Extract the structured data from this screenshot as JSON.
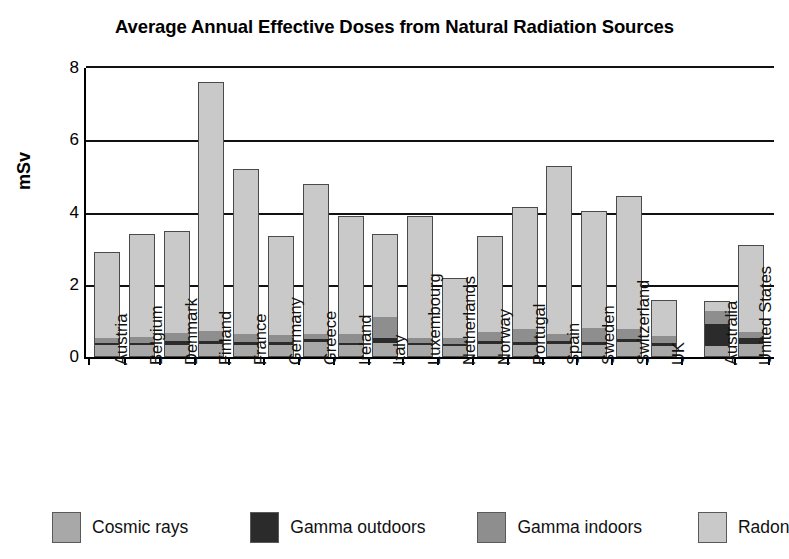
{
  "chart_data": {
    "type": "bar",
    "subtype": "stacked-vertical",
    "title": "Average Annual Effective Doses from Natural Radiation Sources",
    "xlabel": "",
    "ylabel": "mSv",
    "ylim": [
      0,
      8
    ],
    "yticks": [
      0,
      2,
      4,
      6,
      8
    ],
    "grid": "horizontal",
    "legend_position": "bottom",
    "units": "mSv",
    "categories": [
      "Austria",
      "Belgium",
      "Denmark",
      "Finland",
      "France",
      "Germany",
      "Greece",
      "Ireland",
      "Italy",
      "Luxembourg",
      "Netherlands",
      "Norway",
      "Portugal",
      "Spain",
      "Sweden",
      "Switzerland",
      "UK",
      "Australia",
      "United States"
    ],
    "series": [
      {
        "name": "Cosmic rays",
        "color": "#a8a8a8",
        "values": [
          0.3,
          0.3,
          0.3,
          0.33,
          0.3,
          0.3,
          0.38,
          0.3,
          0.38,
          0.3,
          0.28,
          0.33,
          0.3,
          0.33,
          0.3,
          0.38,
          0.3,
          0.3,
          0.33
        ]
      },
      {
        "name": "Gamma outdoors",
        "color": "#2b2b2b",
        "values": [
          0.07,
          0.07,
          0.11,
          0.1,
          0.1,
          0.09,
          0.09,
          0.08,
          0.12,
          0.08,
          0.06,
          0.09,
          0.1,
          0.1,
          0.08,
          0.1,
          0.07,
          0.63,
          0.18
        ]
      },
      {
        "name": "Gamma indoors",
        "color": "#8e8e8e",
        "values": [
          0.13,
          0.17,
          0.24,
          0.27,
          0.23,
          0.2,
          0.15,
          0.25,
          0.6,
          0.14,
          0.17,
          0.25,
          0.35,
          0.2,
          0.4,
          0.28,
          0.2,
          0.37,
          0.18
        ]
      },
      {
        "name": "Radon",
        "color": "#c9c9c9",
        "values": [
          2.4,
          2.86,
          2.85,
          6.9,
          4.57,
          2.75,
          4.18,
          3.27,
          2.3,
          3.38,
          1.69,
          2.68,
          3.4,
          4.67,
          3.27,
          3.69,
          1.0,
          0.25,
          2.41
        ]
      }
    ],
    "totals": [
      2.9,
      3.4,
      3.5,
      7.6,
      5.2,
      3.35,
      4.8,
      3.9,
      3.4,
      3.9,
      2.2,
      3.35,
      4.15,
      5.3,
      4.05,
      4.45,
      1.57,
      1.55,
      3.1
    ]
  },
  "legend": {
    "items": [
      {
        "label": "Cosmic rays",
        "color": "#a8a8a8"
      },
      {
        "label": "Gamma outdoors",
        "color": "#2b2b2b"
      },
      {
        "label": "Gamma indoors",
        "color": "#8e8e8e"
      },
      {
        "label": "Radon",
        "color": "#c9c9c9"
      }
    ]
  }
}
